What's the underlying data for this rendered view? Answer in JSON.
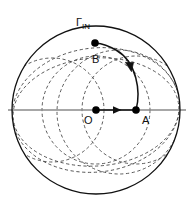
{
  "figure": {
    "title_label": "Γ",
    "boundary_label_base": "Γ",
    "boundary_label_sub": "IN",
    "labels": {
      "origin": "O",
      "point_a": "A",
      "point_b": "B"
    },
    "colors": {
      "stroke_solid": "#111111",
      "stroke_dashed": "#4a4a4a",
      "axis_gray": "#8a8a8a",
      "background": "#ffffff",
      "dot_fill": "#000000"
    },
    "geometry": {
      "main_circle": {
        "cx": 96,
        "cy": 110,
        "r": 84
      },
      "axis_line": {
        "x1": 8,
        "y1": 110,
        "x2": 186,
        "y2": 110
      },
      "points": {
        "O": {
          "x": 96,
          "y": 110
        },
        "A": {
          "x": 136,
          "y": 110
        },
        "B": {
          "x": 95,
          "y": 43
        }
      },
      "dot_radius": 3.6,
      "arrow_oa": {
        "x1": 96,
        "y1": 110,
        "x2": 136,
        "y2": 110
      },
      "arc_ab_arrow_at": {
        "x": 130,
        "y": 68
      }
    },
    "label_positions": {
      "gamma": {
        "x": 76,
        "y": 17
      },
      "O": {
        "x": 84,
        "y": 116
      },
      "A": {
        "x": 142,
        "y": 116
      },
      "B": {
        "x": 92,
        "y": 55
      }
    },
    "dashed_curves_count": 6,
    "solid_curves_count": 2
  }
}
